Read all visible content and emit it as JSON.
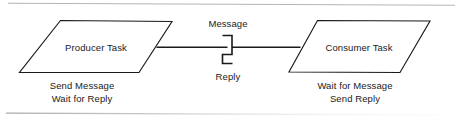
{
  "diagram": {
    "stroke_color": "#1a1a1a",
    "fill_color": "#ffffff",
    "rule_color": "#b9b9bd",
    "nodes": [
      {
        "id": "producer",
        "shape": "parallelogram",
        "label": "Producer Task",
        "caption_lines": [
          "Send Message",
          "Wait for Reply"
        ]
      },
      {
        "id": "consumer",
        "shape": "parallelogram",
        "label": "Consumer Task",
        "caption_lines": [
          "Wait for Message",
          "Send Reply"
        ]
      }
    ],
    "connector": {
      "from": "producer",
      "to": "consumer",
      "style": "z-bend-rendezvous",
      "labels": {
        "top": "Message",
        "bottom": "Reply"
      }
    }
  }
}
